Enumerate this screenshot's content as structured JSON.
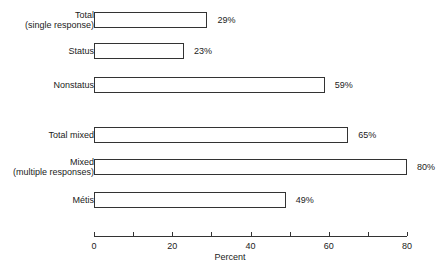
{
  "chart_data": {
    "type": "bar",
    "orientation": "horizontal",
    "title": "",
    "xlabel": "Percent",
    "ylabel": "",
    "xlim": [
      0,
      80
    ],
    "xticks": [
      0,
      20,
      40,
      60,
      80
    ],
    "minor_ticks": [
      10,
      30,
      50,
      70
    ],
    "grid": false,
    "legend": null,
    "categories": [
      "Total\n(single response)",
      "Status",
      "Nonstatus",
      "Total mixed",
      "Mixed\n(multiple responses)",
      "Métis"
    ],
    "values": [
      29,
      23,
      59,
      65,
      80,
      49
    ],
    "value_labels": [
      "29%",
      "23%",
      "59%",
      "65%",
      "80%",
      "49%"
    ]
  }
}
